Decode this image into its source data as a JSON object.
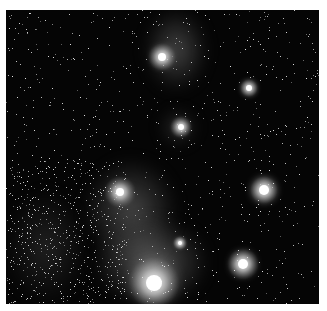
{
  "image": {
    "subject": "star-field-with-nebulae",
    "description": "Grayscale astronomical photograph of a dense star field with bright stars and diffuse nebular clouds",
    "palette": {
      "background": "#050505",
      "border": "#ffffff",
      "nebula": "#8a8a8a",
      "star": "#ffffff"
    },
    "bright_stars": [
      {
        "x": 156,
        "y": 47,
        "r": 4,
        "glow": 14
      },
      {
        "x": 243,
        "y": 78,
        "r": 3,
        "glow": 9
      },
      {
        "x": 175,
        "y": 117,
        "r": 3,
        "glow": 11
      },
      {
        "x": 114,
        "y": 182,
        "r": 4,
        "glow": 16
      },
      {
        "x": 258,
        "y": 180,
        "r": 5,
        "glow": 14
      },
      {
        "x": 174,
        "y": 233,
        "r": 2,
        "glow": 7
      },
      {
        "x": 237,
        "y": 254,
        "r": 5,
        "glow": 16
      },
      {
        "x": 148,
        "y": 273,
        "r": 8,
        "glow": 26
      }
    ],
    "nebulae": [
      {
        "x": 140,
        "y": 0,
        "w": 60,
        "h": 80,
        "o": 0.35
      },
      {
        "x": 155,
        "y": 100,
        "w": 35,
        "h": 35,
        "o": 0.25
      },
      {
        "x": 80,
        "y": 150,
        "w": 90,
        "h": 100,
        "o": 0.35
      },
      {
        "x": 90,
        "y": 210,
        "w": 110,
        "h": 84,
        "o": 0.45
      },
      {
        "x": 0,
        "y": 180,
        "w": 80,
        "h": 114,
        "o": 0.15
      }
    ]
  }
}
